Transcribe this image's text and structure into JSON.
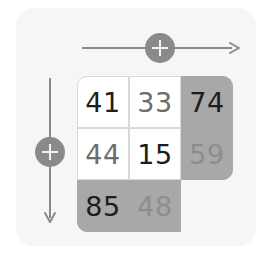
{
  "widget": {
    "title": "Matrix Grid With Axis Controls",
    "panel_color": "#f6f6f6",
    "canvas_color": "#ffffff"
  },
  "axes": {
    "horizontal": {
      "name": "horizontal-axis",
      "direction": "right",
      "arrow_icon": "arrow-right-icon",
      "knob_icon": "plus-icon",
      "knob_label": "+",
      "color": "#8a8a8a"
    },
    "vertical": {
      "name": "vertical-axis",
      "direction": "down",
      "arrow_icon": "arrow-down-icon",
      "knob_icon": "plus-icon",
      "knob_label": "+",
      "color": "#8a8a8a"
    }
  },
  "grid": {
    "rows": 3,
    "cols": 3,
    "cell_white": "#ffffff",
    "cell_shade": "#a8a8a8",
    "ink_dark": "#1d1d1d",
    "ink_mid": "#6d6d6d",
    "ink_light": "#8d8d8d",
    "cells": [
      {
        "id": "r1c1",
        "value": "41",
        "fill": "white",
        "ink": "dark",
        "corner": "tl"
      },
      {
        "id": "r1c2",
        "value": "33",
        "fill": "white",
        "ink": "mid",
        "corner": ""
      },
      {
        "id": "r1c3",
        "value": "74",
        "fill": "shade",
        "ink": "dark",
        "corner": "tr"
      },
      {
        "id": "r2c1",
        "value": "44",
        "fill": "white",
        "ink": "mid",
        "corner": ""
      },
      {
        "id": "r2c2",
        "value": "15",
        "fill": "white",
        "ink": "dark",
        "corner": ""
      },
      {
        "id": "r2c3",
        "value": "59",
        "fill": "shade",
        "ink": "light",
        "corner": "br"
      },
      {
        "id": "r3c1",
        "value": "85",
        "fill": "shade",
        "ink": "dark",
        "corner": "bl"
      },
      {
        "id": "r3c2",
        "value": "48",
        "fill": "shade",
        "ink": "light",
        "corner": ""
      },
      {
        "id": "r3c3",
        "value": "",
        "fill": "empty",
        "ink": "mid",
        "corner": ""
      }
    ]
  }
}
